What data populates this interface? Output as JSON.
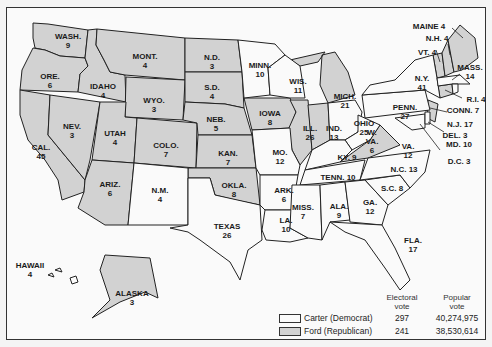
{
  "colors": {
    "carter": "#fafafa",
    "ford": "#d2d2d2",
    "border": "#222222"
  },
  "states": {
    "wash": {
      "name": "WASH.",
      "votes": "9",
      "winner": "ford"
    },
    "ore": {
      "name": "ORE.",
      "votes": "6",
      "winner": "ford"
    },
    "cal": {
      "name": "CAL.",
      "votes": "45",
      "winner": "ford"
    },
    "idaho": {
      "name": "IDAHO",
      "votes": "4",
      "winner": "ford"
    },
    "nev": {
      "name": "NEV.",
      "votes": "3",
      "winner": "ford"
    },
    "mont": {
      "name": "MONT.",
      "votes": "4",
      "winner": "ford"
    },
    "wyo": {
      "name": "WYO.",
      "votes": "3",
      "winner": "ford"
    },
    "utah": {
      "name": "UTAH",
      "votes": "4",
      "winner": "ford"
    },
    "ariz": {
      "name": "ARIZ.",
      "votes": "6",
      "winner": "ford"
    },
    "colo": {
      "name": "COLO.",
      "votes": "7",
      "winner": "ford"
    },
    "nm": {
      "name": "N.M.",
      "votes": "4",
      "winner": "ford"
    },
    "nd": {
      "name": "N.D.",
      "votes": "3",
      "winner": "ford"
    },
    "sd": {
      "name": "S.D.",
      "votes": "4",
      "winner": "ford"
    },
    "neb": {
      "name": "NEB.",
      "votes": "5",
      "winner": "ford"
    },
    "kan": {
      "name": "KAN.",
      "votes": "7",
      "winner": "ford"
    },
    "okla": {
      "name": "OKLA.",
      "votes": "8",
      "winner": "ford"
    },
    "texas": {
      "name": "TEXAS",
      "votes": "26",
      "winner": "carter"
    },
    "minn": {
      "name": "MINN.",
      "votes": "10",
      "winner": "carter"
    },
    "iowa": {
      "name": "IOWA",
      "votes": "8",
      "winner": "ford"
    },
    "mo": {
      "name": "MO.",
      "votes": "12",
      "winner": "carter"
    },
    "ark": {
      "name": "ARK.",
      "votes": "6",
      "winner": "carter"
    },
    "la": {
      "name": "LA.",
      "votes": "10",
      "winner": "carter"
    },
    "wis": {
      "name": "WIS.",
      "votes": "11",
      "winner": "carter"
    },
    "ill": {
      "name": "ILL.",
      "votes": "26",
      "winner": "ford"
    },
    "mich": {
      "name": "MICH.",
      "votes": "21",
      "winner": "ford"
    },
    "ind": {
      "name": "IND.",
      "votes": "13",
      "winner": "ford"
    },
    "ohio": {
      "name": "OHIO",
      "votes": "25",
      "winner": "carter"
    },
    "ky": {
      "name": "KY.",
      "votes": "9",
      "winner": "carter"
    },
    "tenn": {
      "name": "TENN.",
      "votes": "10",
      "winner": "carter"
    },
    "miss": {
      "name": "MISS.",
      "votes": "7",
      "winner": "carter"
    },
    "ala": {
      "name": "ALA.",
      "votes": "9",
      "winner": "carter"
    },
    "ga": {
      "name": "GA.",
      "votes": "12",
      "winner": "carter"
    },
    "fla": {
      "name": "FLA.",
      "votes": "17",
      "winner": "carter"
    },
    "sc": {
      "name": "S.C.",
      "votes": "8",
      "winner": "carter"
    },
    "nc": {
      "name": "N.C.",
      "votes": "13",
      "winner": "carter"
    },
    "va": {
      "name": "VA.",
      "votes": "12",
      "winner": "ford"
    },
    "wva": {
      "name": "W. VA.",
      "votes": "6",
      "winner": "carter"
    },
    "penn": {
      "name": "PENN.",
      "votes": "27",
      "winner": "carter"
    },
    "ny": {
      "name": "N.Y.",
      "votes": "41",
      "winner": "carter"
    },
    "vt": {
      "name": "VT.",
      "votes": "4",
      "winner": "ford"
    },
    "nh": {
      "name": "N.H.",
      "votes": "4",
      "winner": "ford"
    },
    "maine": {
      "name": "MAINE",
      "votes": "4",
      "winner": "ford"
    },
    "mass": {
      "name": "MASS.",
      "votes": "14",
      "winner": "carter"
    },
    "ri": {
      "name": "R.I.",
      "votes": "4",
      "winner": "carter"
    },
    "conn": {
      "name": "CONN.",
      "votes": "7",
      "winner": "ford"
    },
    "nj": {
      "name": "N.J.",
      "votes": "17",
      "winner": "ford"
    },
    "del": {
      "name": "DEL.",
      "votes": "3",
      "winner": "carter"
    },
    "md": {
      "name": "MD.",
      "votes": "10",
      "winner": "carter"
    },
    "dc": {
      "name": "D.C.",
      "votes": "3",
      "winner": "carter"
    },
    "hawaii": {
      "name": "HAWAII",
      "votes": "4",
      "winner": "carter"
    },
    "alaska": {
      "name": "ALASKA",
      "votes": "3",
      "winner": "ford"
    }
  },
  "legend": {
    "col_electoral": "Electoral vote",
    "col_electoral_l1": "Electoral",
    "col_electoral_l2": "vote",
    "col_popular_l1": "Popular",
    "col_popular_l2": "vote",
    "rows": [
      {
        "label": "Carter (Democrat)",
        "electoral": "297",
        "popular": "40,274,975",
        "swatch": "carter"
      },
      {
        "label": "Ford (Republican)",
        "electoral": "241",
        "popular": "38,530,614",
        "swatch": "ford"
      }
    ]
  }
}
